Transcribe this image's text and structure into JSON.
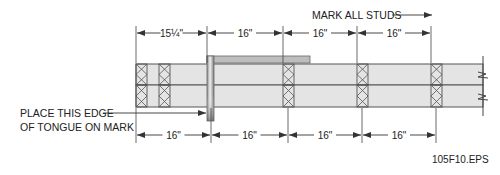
{
  "figure_id": "105F10.EPS",
  "header_note": "MARK ALL STUDS",
  "callout": {
    "line1": "PLACE THIS EDGE",
    "line2": "OF TONGUE ON MARK"
  },
  "top_dimensions": [
    {
      "label": "15¼\"",
      "x1": 136,
      "x2": 207
    },
    {
      "label": "16\"",
      "x1": 207,
      "x2": 283
    },
    {
      "label": "16\"",
      "x1": 283,
      "x2": 357
    },
    {
      "label": "16\"",
      "x1": 357,
      "x2": 431
    }
  ],
  "bottom_dimensions": [
    {
      "label": "16\"",
      "x1": 136,
      "x2": 211
    },
    {
      "label": "16\"",
      "x1": 211,
      "x2": 288
    },
    {
      "label": "16\"",
      "x1": 288,
      "x2": 362
    },
    {
      "label": "16\"",
      "x1": 362,
      "x2": 436
    }
  ],
  "studs_x": [
    136,
    159,
    283,
    357,
    431
  ],
  "colors": {
    "panel_fill": "#e4e4e4",
    "line": "#555555",
    "tongue_fill": "#b9b9b9",
    "text": "#222222"
  }
}
